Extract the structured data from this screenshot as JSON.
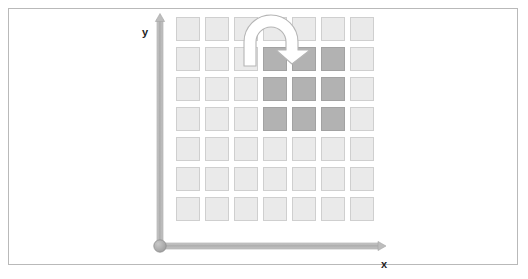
{
  "figure": {
    "type": "diagram",
    "background_color": "#ffffff",
    "frame_color": "#b9b9b9"
  },
  "axes": {
    "x_label": "x",
    "y_label": "y",
    "axis_color": "#b0b0b0",
    "origin_marker": "origin-dot",
    "x_axis_start": [
      160,
      246
    ],
    "x_axis_end": [
      386,
      246
    ],
    "y_axis_start": [
      160,
      246
    ],
    "y_axis_end": [
      160,
      16
    ]
  },
  "grid": {
    "columns": 7,
    "rows": 7,
    "cell_size_px": 24,
    "light_cell_color": "#eaeaea",
    "dark_cell_color": "#b2b2b2",
    "cell_border_color": "#cfcfcf",
    "highlighted_region": {
      "columns": [
        4,
        5,
        6
      ],
      "rows": [
        2,
        3,
        4
      ],
      "label": "rotated-block"
    },
    "cells": [
      [
        "light",
        "light",
        "light",
        "light",
        "light",
        "light",
        "light"
      ],
      [
        "light",
        "light",
        "light",
        "dark",
        "dark",
        "dark",
        "light"
      ],
      [
        "light",
        "light",
        "light",
        "dark",
        "dark",
        "dark",
        "light"
      ],
      [
        "light",
        "light",
        "light",
        "dark",
        "dark",
        "dark",
        "light"
      ],
      [
        "light",
        "light",
        "light",
        "light",
        "light",
        "light",
        "light"
      ],
      [
        "light",
        "light",
        "light",
        "light",
        "light",
        "light",
        "light"
      ],
      [
        "light",
        "light",
        "light",
        "light",
        "light",
        "light",
        "light"
      ]
    ]
  },
  "annotations": {
    "rotation_arrow": {
      "icon": "rotation-arrow-icon",
      "direction": "clockwise",
      "fill": "#ffffff",
      "stroke": "#b5b5b5"
    }
  }
}
